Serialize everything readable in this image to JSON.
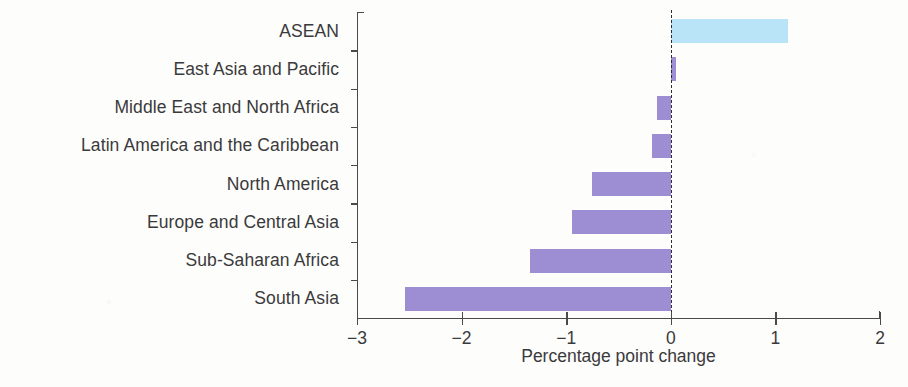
{
  "chart_data": {
    "type": "bar",
    "orientation": "horizontal",
    "title": "",
    "xlabel": "Percentage point change",
    "ylabel": "",
    "xlim": [
      -3,
      2
    ],
    "xticks": [
      -3,
      -2,
      -1,
      0,
      1,
      2
    ],
    "xtick_labels": [
      "−3",
      "−2",
      "−1",
      "0",
      "1",
      "2"
    ],
    "grid": false,
    "legend": null,
    "zero_reference_line": true,
    "categories": [
      "ASEAN",
      "East Asia and Pacific",
      "Middle East and North Africa",
      "Latin America and the Caribbean",
      "North America",
      "Europe and Central Asia",
      "Sub-Saharan Africa",
      "South Asia"
    ],
    "values": [
      1.12,
      0.05,
      -0.13,
      -0.18,
      -0.75,
      -0.94,
      -1.35,
      -2.54
    ],
    "bar_colors": [
      "#b9e3f6",
      "#9d8ed3",
      "#9d8ed3",
      "#9d8ed3",
      "#9d8ed3",
      "#9d8ed3",
      "#9d8ed3",
      "#9d8ed3"
    ],
    "highlight_category": "ASEAN",
    "highlight_color": "#b9e3f6",
    "series_color": "#9d8ed3",
    "axis_color": "#4a4a4a",
    "text_color": "#3a3a3c",
    "background_color": "#fdfdfb"
  }
}
